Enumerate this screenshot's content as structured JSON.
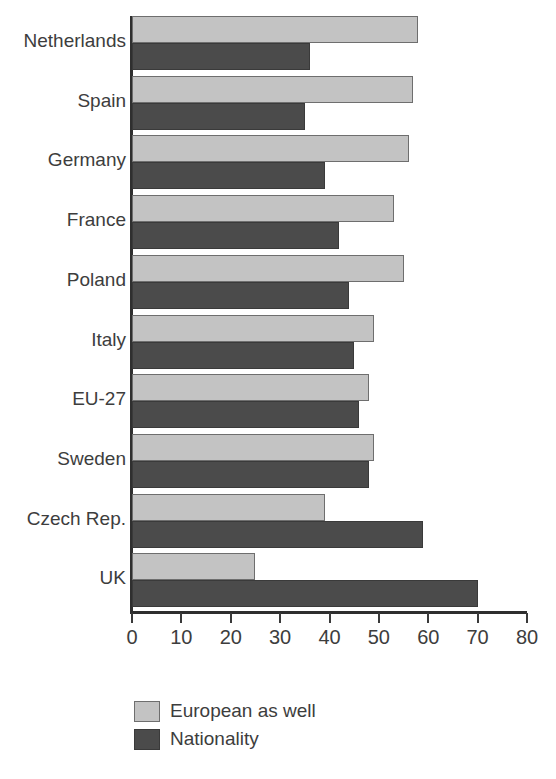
{
  "chart_data": {
    "type": "bar",
    "orientation": "horizontal",
    "title": "",
    "xlabel": "",
    "ylabel": "",
    "xlim": [
      0,
      80
    ],
    "xticks": [
      0,
      10,
      20,
      30,
      40,
      50,
      60,
      70,
      80
    ],
    "xtick_labels": [
      "0",
      "10",
      "20",
      "30",
      "40",
      "50",
      "60",
      "70",
      "80"
    ],
    "grid": false,
    "legend_position": "bottom-left",
    "categories": [
      "Netherlands",
      "Spain",
      "Germany",
      "France",
      "Poland",
      "Italy",
      "EU-27",
      "Sweden",
      "Czech Rep.",
      "UK"
    ],
    "series": [
      {
        "name": "European as well",
        "color": "#c3c3c3",
        "values": [
          58,
          57,
          56,
          53,
          55,
          49,
          48,
          49,
          39,
          25
        ]
      },
      {
        "name": "Nationality",
        "color": "#4b4b4b",
        "values": [
          36,
          35,
          39,
          42,
          44,
          45,
          46,
          48,
          59,
          70
        ]
      }
    ]
  },
  "legend": {
    "items": [
      {
        "label": "European as well",
        "swatch": "light"
      },
      {
        "label": "Nationality",
        "swatch": "dark"
      }
    ]
  },
  "colors": {
    "light_series": "#c3c3c3",
    "dark_series": "#4b4b4b",
    "axis": "#2f2f2f",
    "text": "#3d3d3d",
    "background": "#ffffff"
  }
}
